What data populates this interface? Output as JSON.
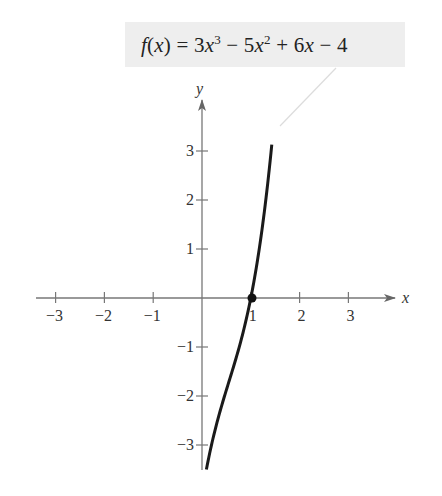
{
  "chart_data": {
    "type": "line",
    "function": "3x^3 - 5x^2 + 6x - 4",
    "xlabel": "x",
    "ylabel": "y",
    "xlim": [
      -3.4,
      4.0
    ],
    "ylim": [
      -3.5,
      4.0
    ],
    "x_ticks": [
      -3,
      -2,
      -1,
      1,
      2,
      3
    ],
    "x_tick_labels": [
      "−3",
      "−2",
      "−1",
      "1",
      "2",
      "3"
    ],
    "y_ticks": [
      -3,
      -2,
      -1,
      1,
      2,
      3
    ],
    "y_tick_labels": [
      "−3",
      "−2",
      "−1",
      "1",
      "2",
      "3"
    ],
    "grid": false,
    "legend": "none",
    "series": [
      {
        "name": "f(x)",
        "x": [
          0.09,
          0.2,
          0.4,
          0.6,
          0.8,
          0.91,
          1.0,
          1.1,
          1.2,
          1.3,
          1.43
        ],
        "y": [
          -3.5,
          -3.0,
          -2.21,
          -1.55,
          -0.78,
          -0.29,
          0.0,
          0.54,
          1.18,
          2.0,
          3.7
        ]
      }
    ],
    "annotations": [
      {
        "type": "point",
        "x": 0.91,
        "y": 0,
        "label": "real zero near x ≈ 1"
      },
      {
        "type": "callout",
        "text": "f(x) = 3x³ − 5x² + 6x − 4",
        "points_to": [
          1.43,
          3.6
        ]
      }
    ]
  },
  "equation": {
    "lhs_f": "f",
    "lhs_paren": "(x)",
    "eq": " = 3",
    "x1": "x",
    "exp3": "3",
    "minus5": " − 5",
    "x2": "x",
    "exp2": "2",
    "plus6": " + 6",
    "x3": "x",
    "minus4": " − 4"
  },
  "axes": {
    "x_label": "x",
    "y_label": "y",
    "x_ticks": [
      "−3",
      "−2",
      "−1",
      "1",
      "2",
      "3"
    ],
    "y_ticks": [
      "3",
      "2",
      "1",
      "−1",
      "−2",
      "−3"
    ]
  }
}
